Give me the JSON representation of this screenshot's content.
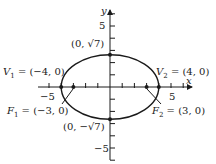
{
  "diagram": {
    "type": "ellipse",
    "equation_params": {
      "a": 4,
      "b_squared": 7,
      "c": 3
    },
    "axes": {
      "x_label": "x",
      "y_label": "y",
      "range": [
        -6,
        6
      ],
      "tick_step": 1
    },
    "tick_labels": {
      "x_neg": "−5",
      "x_pos": "5",
      "y_pos": "5",
      "y_neg": "−5"
    },
    "points": [
      {
        "id": "V1",
        "x": -4,
        "y": 0,
        "label_main": "V",
        "label_sub": "1",
        "label_rest": " = (−4, 0)"
      },
      {
        "id": "V2",
        "x": 4,
        "y": 0,
        "label_main": "V",
        "label_sub": "2",
        "label_rest": " = (4, 0)"
      },
      {
        "id": "F1",
        "x": -3,
        "y": 0,
        "label_main": "F",
        "label_sub": "1",
        "label_rest": " = (−3, 0)"
      },
      {
        "id": "F2",
        "x": 3,
        "y": 0,
        "label_main": "F",
        "label_sub": "2",
        "label_rest": " = (3, 0)"
      },
      {
        "id": "top",
        "x": 0,
        "y": 2.6458,
        "label": "(0, √7)"
      },
      {
        "id": "bottom",
        "x": 0,
        "y": -2.6458,
        "label": "(0, −√7)"
      }
    ]
  }
}
